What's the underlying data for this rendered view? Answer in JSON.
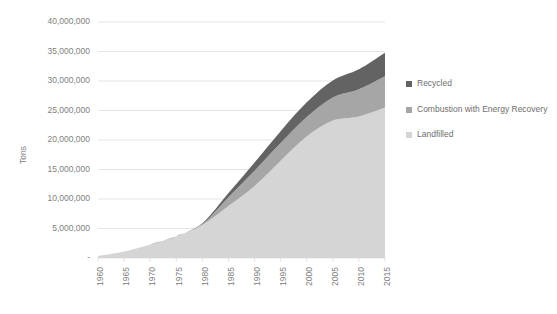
{
  "chart_data": {
    "type": "area",
    "stacked": true,
    "title": "",
    "subtitle": "",
    "xlabel": "",
    "ylabel": "Tons",
    "x": [
      1960,
      1965,
      1970,
      1975,
      1980,
      1985,
      1990,
      1995,
      2000,
      2005,
      2010,
      2015
    ],
    "xtick_labels": [
      "1960",
      "1965",
      "1970",
      "1975",
      "1980",
      "1985",
      "1990",
      "1995",
      "2000",
      "2005",
      "2010",
      "2015"
    ],
    "ytick_labels": [
      "-",
      "5,000,000",
      "10,000,000",
      "15,000,000",
      "20,000,000",
      "25,000,000",
      "30,000,000",
      "35,000,000",
      "40,000,000"
    ],
    "ytick_values": [
      0,
      5000000,
      10000000,
      15000000,
      20000000,
      25000000,
      30000000,
      35000000,
      40000000
    ],
    "ylim": [
      0,
      40000000
    ],
    "xlim": [
      1960,
      2015
    ],
    "grid": true,
    "grid_axis": "y",
    "legend_position": "right",
    "series": [
      {
        "name": "Landfilled",
        "color": "#d5d5d5",
        "values": [
          350000,
          1100000,
          2300000,
          3700000,
          5600000,
          8800000,
          12200000,
          16500000,
          20600000,
          23300000,
          24000000,
          25500000
        ]
      },
      {
        "name": "Combustion with Energy Recovery",
        "color": "#a6a6a6",
        "values": [
          0,
          0,
          0,
          0,
          150000,
          1500000,
          2600000,
          3000000,
          3300000,
          3900000,
          4600000,
          5300000
        ]
      },
      {
        "name": "Recycled",
        "color": "#636363",
        "values": [
          0,
          0,
          0,
          0,
          150000,
          700000,
          1400000,
          2000000,
          2500000,
          2900000,
          3400000,
          4000000
        ]
      }
    ],
    "totals": [
      350000,
      1100000,
      2300000,
      3700000,
      5900000,
      11000000,
      16200000,
      21500000,
      26400000,
      30100000,
      32000000,
      34800000
    ]
  },
  "legend": {
    "items": [
      {
        "label": "Recycled",
        "color": "#636363"
      },
      {
        "label": "Combustion with Energy Recovery",
        "color": "#a6a6a6"
      },
      {
        "label": "Landfilled",
        "color": "#d5d5d5"
      }
    ]
  }
}
